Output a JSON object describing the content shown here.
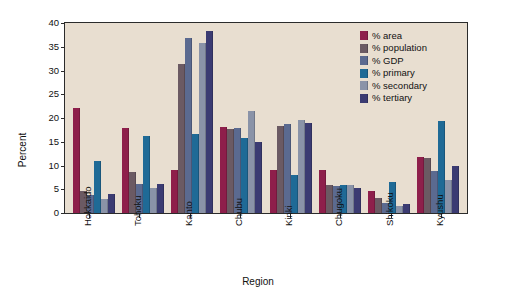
{
  "chart_data": {
    "type": "bar",
    "title": "",
    "xlabel": "Region",
    "ylabel": "Percent",
    "ylim": [
      0,
      40
    ],
    "yticks": [
      0,
      5,
      10,
      15,
      20,
      25,
      30,
      35,
      40
    ],
    "grid": false,
    "legend_position": "upper right",
    "categories": [
      "Hokkaido",
      "Tohoku",
      "Kanto",
      "Chubu",
      "Kinki",
      "Chugoku",
      "Shikoku",
      "Kyushu"
    ],
    "series": [
      {
        "name": "% area",
        "color": "#8e1f4b",
        "values": [
          22.2,
          17.8,
          9.1,
          18.1,
          9.0,
          9.1,
          4.7,
          11.7
        ]
      },
      {
        "name": "% population",
        "color": "#6b5a63",
        "values": [
          4.7,
          8.6,
          31.3,
          17.6,
          18.3,
          6.0,
          3.2,
          11.5
        ]
      },
      {
        "name": "% GDP",
        "color": "#5b6a90",
        "values": [
          3.8,
          6.2,
          36.9,
          17.8,
          18.8,
          5.6,
          2.2,
          8.9
        ]
      },
      {
        "name": "% primary",
        "color": "#1f6a96",
        "values": [
          11.0,
          16.2,
          16.6,
          15.8,
          8.1,
          6.0,
          6.5,
          19.3
        ]
      },
      {
        "name": "% secondary",
        "color": "#8a93a8",
        "values": [
          3.0,
          5.2,
          35.8,
          21.5,
          19.6,
          5.8,
          1.5,
          6.9
        ]
      },
      {
        "name": "% tertiary",
        "color": "#3b3b72",
        "values": [
          4.1,
          6.1,
          38.4,
          15.0,
          18.9,
          5.2,
          1.9,
          9.9
        ]
      }
    ]
  },
  "colors": {
    "plot_background": "#e8ded0",
    "page_background": "#ffffff",
    "axis": "#2b2b2b",
    "text": "#111111"
  }
}
